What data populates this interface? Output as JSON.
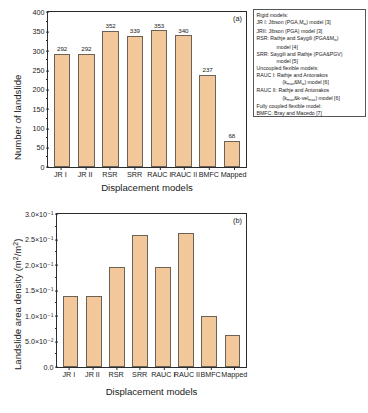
{
  "figure": {
    "panel_a_tag": "(a)",
    "panel_b_tag": "(b)"
  },
  "chart_data": [
    {
      "type": "bar",
      "panel": "(a)",
      "title": "",
      "xlabel": "Displacement models",
      "ylabel": "Number of landslide",
      "categories": [
        "JR I",
        "JR II",
        "RSR",
        "SRR",
        "RAUC I",
        "RAUC II",
        "BMFC",
        "Mapped"
      ],
      "values": [
        292,
        292,
        352,
        339,
        353,
        340,
        237,
        68
      ],
      "data_labels": [
        "292",
        "292",
        "352",
        "339",
        "353",
        "340",
        "237",
        "68"
      ],
      "ylim": [
        0,
        400
      ],
      "yticks": [
        0,
        50,
        100,
        150,
        200,
        250,
        300,
        350,
        400
      ],
      "ytick_labels": [
        "0",
        "50",
        "100",
        "150",
        "200",
        "250",
        "300",
        "350",
        "400"
      ],
      "grid": false,
      "legend_position": "upper-right-outside",
      "bar_color": "#F2C89A",
      "bar_edge_color": "#6b6257"
    },
    {
      "type": "bar",
      "panel": "(b)",
      "title": "",
      "xlabel": "Displacement models",
      "ylabel": "Landslide area density (m²/m²)",
      "categories": [
        "JR I",
        "JR II",
        "RSR",
        "SRR",
        "RAUC I",
        "RAUC II",
        "BMFC",
        "Mapped"
      ],
      "values": [
        0.14,
        0.14,
        0.196,
        0.258,
        0.197,
        0.262,
        0.1,
        0.062
      ],
      "data_labels": [
        "",
        "",
        "",
        "",
        "",
        "",
        "",
        ""
      ],
      "ylim": [
        0.0,
        0.3
      ],
      "yticks": [
        0.0,
        0.05,
        0.1,
        0.15,
        0.2,
        0.25,
        0.3
      ],
      "ytick_labels": [
        "0.0",
        "5.0×10⁻²",
        "1.0×10⁻¹",
        "1.5×10⁻¹",
        "2.0×10⁻¹",
        "2.5×10⁻¹",
        "3.0×10⁻¹"
      ],
      "grid": false,
      "legend_position": "none",
      "bar_color": "#F2C89A",
      "bar_edge_color": "#6b6257"
    }
  ],
  "legend": {
    "lines": [
      {
        "text": "Rigid models:",
        "indent": 0
      },
      {
        "text": "JR I: Jibson (PGA,M_w) model [3]",
        "indent": 0
      },
      {
        "text": "JRII: Jibson (PGA) model [3]",
        "indent": 0
      },
      {
        "text": "RSR: Rathje and Saygili (PGA&M_w)",
        "indent": 0
      },
      {
        "text": "model [4]",
        "indent": 1
      },
      {
        "text": "SRR: Saygili and Rathje (PGA&PGV)",
        "indent": 0
      },
      {
        "text": "model [5]",
        "indent": 1
      },
      {
        "text": "Uncoupled flexible models:",
        "indent": 0
      },
      {
        "text": "RAUC I: Rathje and Antonakos",
        "indent": 0
      },
      {
        "text": "(k_max&M_w) model [6]",
        "indent": 2
      },
      {
        "text": "RAUC II: Rathje and Antonakos",
        "indent": 0
      },
      {
        "text": "(k_max&k-vel_max) model [6]",
        "indent": 2
      },
      {
        "text": "Fully coupled flexible model:",
        "indent": 0
      },
      {
        "text": "BMFC: Bray and Macedo [7]",
        "indent": 0
      }
    ]
  }
}
